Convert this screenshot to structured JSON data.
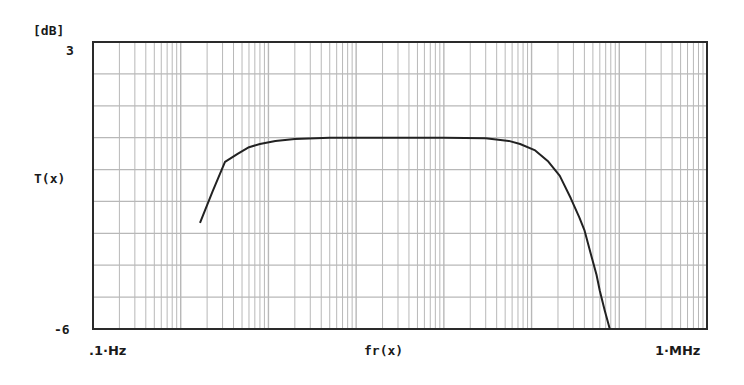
{
  "chart_data": {
    "type": "line",
    "title": "",
    "xlabel": "fr(x)",
    "ylabel": "T(x)",
    "y_unit_label": "[dB]",
    "xscale": "log",
    "xlim_hz": [
      0.1,
      1000000
    ],
    "x_tick_labels": [
      ".1·Hz",
      "1·MHz"
    ],
    "ylim": [
      -6,
      3
    ],
    "y_tick_labels": [
      "3",
      "-6"
    ],
    "y_gridline_step_db": 1,
    "grid": true,
    "x_minor_grid": "log (1..9 per decade)",
    "legend": null,
    "series": [
      {
        "name": "T(x)",
        "color": "#222222",
        "points_hz_db": [
          [
            1.66,
            -2.67
          ],
          [
            2.3,
            -1.7
          ],
          [
            3.2,
            -0.76
          ],
          [
            4.5,
            -0.5
          ],
          [
            6.0,
            -0.3
          ],
          [
            8.0,
            -0.2
          ],
          [
            12.0,
            -0.1
          ],
          [
            20.0,
            -0.04
          ],
          [
            50.0,
            0.0
          ],
          [
            200.0,
            0.0
          ],
          [
            1000.0,
            0.0
          ],
          [
            3000.0,
            -0.02
          ],
          [
            5500.0,
            -0.1
          ],
          [
            7400.0,
            -0.2
          ],
          [
            11000.0,
            -0.4
          ],
          [
            15500.0,
            -0.75
          ],
          [
            21000.0,
            -1.2
          ],
          [
            28000.0,
            -1.9
          ],
          [
            35000.0,
            -2.5
          ],
          [
            40000.0,
            -2.9
          ],
          [
            48000.0,
            -3.7
          ],
          [
            55000.0,
            -4.3
          ],
          [
            60000.0,
            -4.8
          ],
          [
            68000.0,
            -5.4
          ],
          [
            78000.0,
            -6.0
          ]
        ]
      }
    ]
  },
  "labels": {
    "y_unit": "[dB]",
    "y_top": "3",
    "y_bottom": "-6",
    "y_name": "T(x)",
    "x_left": ".1·Hz",
    "x_right": "1·MHz",
    "x_name": "fr(x)"
  },
  "colors": {
    "frame": "#2a2a2a",
    "grid": "#b8b8b8",
    "curve": "#222222",
    "background": "#ffffff"
  }
}
